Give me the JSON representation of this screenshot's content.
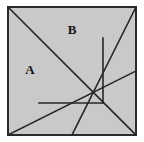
{
  "figure": {
    "name": "tangram-square-dissection",
    "kind": "geometric-diagram",
    "canvas": {
      "width": 144,
      "height": 142
    },
    "colors": {
      "page_background": "#ffffff",
      "square_fill": "#c9c9c9",
      "border_stroke": "#2b2b2b",
      "line_stroke": "#262626",
      "label_color": "#151515"
    },
    "square": {
      "x": 8,
      "y": 7,
      "width": 128,
      "height": 128,
      "border_width": 2
    },
    "line_width": 1.6,
    "cut_lines": [
      {
        "name": "main-diagonal",
        "x1": 8,
        "y1": 7,
        "x2": 136,
        "y2": 135
      },
      {
        "name": "anti-diagonal-upper-right",
        "x1": 136,
        "y1": 7,
        "x2": 72,
        "y2": 135
      },
      {
        "name": "lower-left-to-right-edge",
        "x1": 8,
        "y1": 135,
        "x2": 136,
        "y2": 71
      },
      {
        "name": "vertical-cut",
        "x1": 103,
        "y1": 38,
        "x2": 103,
        "y2": 103
      },
      {
        "name": "horizontal-cut",
        "x1": 39,
        "y1": 103,
        "x2": 103,
        "y2": 103
      }
    ],
    "labels": [
      {
        "name": "piece-label-a",
        "text": "A",
        "x": 30,
        "y": 71
      },
      {
        "name": "piece-label-b",
        "text": "B",
        "x": 72,
        "y": 31
      }
    ]
  }
}
